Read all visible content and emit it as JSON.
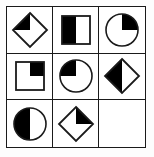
{
  "puzzle": {
    "title": "Matrix reasoning 3x3 grid",
    "type": "visual-analogy-matrix",
    "rows": 3,
    "columns": 3,
    "colors": {
      "fill": "#000000",
      "stroke": "#1a1a1a",
      "background": "#ffffff"
    },
    "cells": [
      {
        "index": 1,
        "row": 1,
        "column": 1,
        "shape": "diamond",
        "shape_label": "diamond",
        "shading": "top-left-quadrant",
        "shading_label": "top-left quarter filled black",
        "empty": false
      },
      {
        "index": 2,
        "row": 1,
        "column": 2,
        "shape": "square",
        "shape_label": "square",
        "shading": "left-half",
        "shading_label": "left half filled black",
        "empty": false
      },
      {
        "index": 3,
        "row": 1,
        "column": 3,
        "shape": "circle",
        "shape_label": "circle",
        "shading": "top-right-quadrant",
        "shading_label": "top-right quarter filled black",
        "empty": false
      },
      {
        "index": 4,
        "row": 2,
        "column": 1,
        "shape": "square",
        "shape_label": "square",
        "shading": "top-right-quadrant",
        "shading_label": "top-right quarter filled black",
        "empty": false
      },
      {
        "index": 5,
        "row": 2,
        "column": 2,
        "shape": "circle",
        "shape_label": "circle",
        "shading": "top-left-quadrant",
        "shading_label": "top-left quarter filled black",
        "empty": false
      },
      {
        "index": 6,
        "row": 2,
        "column": 3,
        "shape": "diamond",
        "shape_label": "diamond",
        "shading": "left-half",
        "shading_label": "left half filled black",
        "empty": false
      },
      {
        "index": 7,
        "row": 3,
        "column": 1,
        "shape": "circle",
        "shape_label": "circle",
        "shading": "left-half",
        "shading_label": "left half filled black",
        "empty": false
      },
      {
        "index": 8,
        "row": 3,
        "column": 2,
        "shape": "diamond",
        "shape_label": "diamond",
        "shading": "top-right-quadrant",
        "shading_label": "top-right quarter filled black",
        "empty": false
      },
      {
        "index": 9,
        "row": 3,
        "column": 3,
        "shape": "none",
        "shape_label": "blank",
        "shading": "none",
        "shading_label": "empty cell",
        "empty": true
      }
    ]
  }
}
